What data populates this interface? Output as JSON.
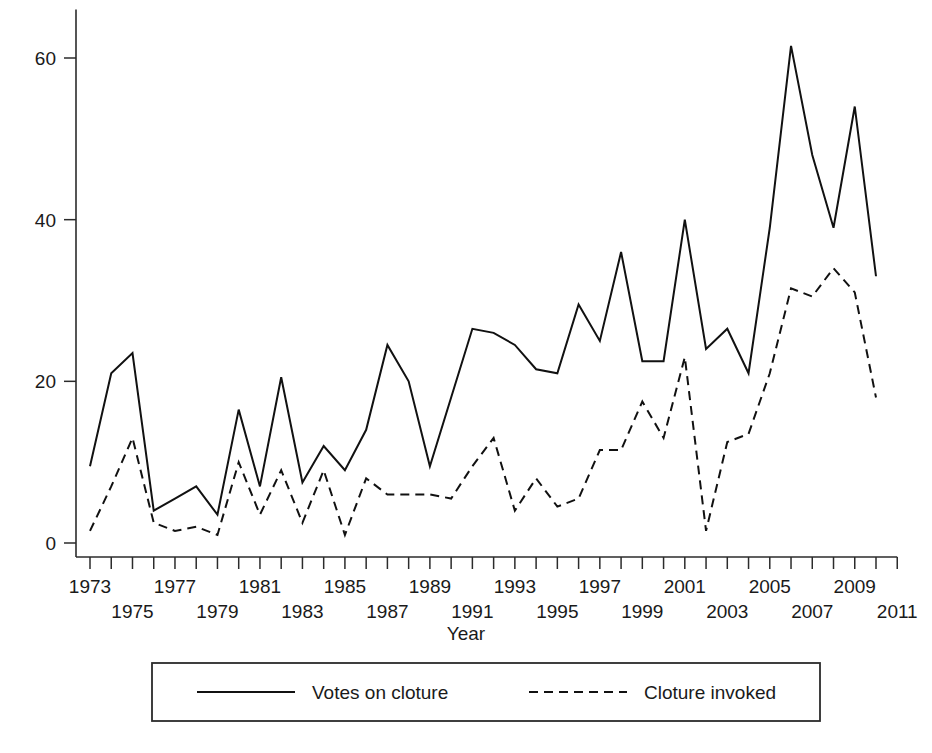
{
  "chart_data": {
    "type": "line",
    "title": "",
    "xlabel": "Year",
    "ylabel": "",
    "xlim": [
      1972,
      2011.5
    ],
    "ylim": [
      0,
      66
    ],
    "grid": false,
    "legend_position": "bottom",
    "y_ticks": [
      0,
      20,
      40,
      60
    ],
    "y_tick_labels": [
      "0",
      "20",
      "40",
      "60"
    ],
    "x_ticks": [
      1973,
      1974,
      1975,
      1976,
      1977,
      1978,
      1979,
      1980,
      1981,
      1982,
      1983,
      1984,
      1985,
      1986,
      1987,
      1988,
      1989,
      1990,
      1991,
      1992,
      1993,
      1994,
      1995,
      1996,
      1997,
      1998,
      1999,
      2000,
      2001,
      2002,
      2003,
      2004,
      2005,
      2006,
      2007,
      2008,
      2009,
      2010,
      2011
    ],
    "x_tick_labels_top_row": [
      "1973",
      "1977",
      "1981",
      "1985",
      "1989",
      "1993",
      "1997",
      "2001",
      "2005",
      "2009"
    ],
    "x_tick_labels_bottom_row": [
      "1975",
      "1979",
      "1983",
      "1987",
      "1991",
      "1995",
      "1999",
      "2003",
      "2007",
      "2011"
    ],
    "x": [
      1973,
      1974,
      1975,
      1976,
      1977,
      1978,
      1979,
      1980,
      1981,
      1982,
      1983,
      1984,
      1985,
      1986,
      1987,
      1988,
      1989,
      1990,
      1991,
      1992,
      1993,
      1994,
      1995,
      1996,
      1997,
      1998,
      1999,
      2000,
      2001,
      2002,
      2003,
      2004,
      2005,
      2006,
      2007,
      2008,
      2009,
      2010
    ],
    "series": [
      {
        "name": "Votes on cloture",
        "style": "solid",
        "values": [
          9.5,
          21,
          23.5,
          4,
          5.5,
          7,
          3.5,
          16.5,
          7,
          20.5,
          7.5,
          12,
          9,
          14,
          24.5,
          20,
          9.5,
          18,
          26.5,
          26,
          24.5,
          21.5,
          21,
          29.5,
          25,
          36,
          22.5,
          22.5,
          40,
          24,
          26.5,
          21,
          39,
          61.5,
          48,
          39,
          54,
          33
        ]
      },
      {
        "name": "Cloture invoked",
        "style": "dashed",
        "values": [
          1.5,
          7,
          13,
          2.5,
          1.5,
          2,
          1,
          10,
          3.5,
          9,
          2.5,
          9,
          1,
          8,
          6,
          6,
          6,
          5.5,
          9.5,
          13,
          4,
          8,
          4.5,
          5.5,
          11.5,
          11.5,
          17.5,
          13,
          23,
          1.5,
          12.5,
          13.5,
          21,
          31.5,
          30.5,
          34,
          31,
          18
        ]
      }
    ]
  },
  "axis": {
    "x_title": "Year"
  },
  "legend": {
    "items": [
      {
        "label": "Votes on cloture",
        "style": "solid"
      },
      {
        "label": "Cloture invoked",
        "style": "dashed"
      }
    ]
  }
}
